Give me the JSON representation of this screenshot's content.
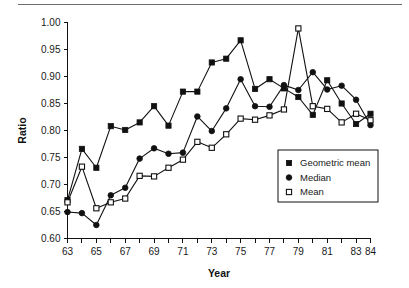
{
  "figure": {
    "name": "ratio-by-year-line-chart",
    "has_top_rule": true
  },
  "axis": {
    "y_title": "Ratio",
    "x_title": "Year",
    "y_ticks": [
      "0.60",
      "0.65",
      "0.70",
      "0.75",
      "0.80",
      "0.85",
      "0.90",
      "0.95",
      "1.00"
    ],
    "x_ticks": [
      "63",
      "65",
      "67",
      "69",
      "71",
      "73",
      "75",
      "77",
      "79",
      "81",
      "83",
      "84"
    ]
  },
  "legend": {
    "items": [
      {
        "label": "Geometric mean",
        "marker": "filled-square-marker",
        "color": "#111111"
      },
      {
        "label": "Median",
        "marker": "filled-circle-marker",
        "color": "#111111"
      },
      {
        "label": "Mean",
        "marker": "open-square-marker",
        "color": "#111111"
      }
    ]
  },
  "chart_data": {
    "type": "line",
    "title": "",
    "xlabel": "Year",
    "ylabel": "Ratio",
    "xlim": [
      63,
      84
    ],
    "ylim": [
      0.6,
      1.0
    ],
    "grid": false,
    "legend_position": "lower-right-inside",
    "x": [
      63,
      64,
      65,
      66,
      67,
      68,
      69,
      70,
      71,
      72,
      73,
      74,
      75,
      76,
      77,
      78,
      79,
      80,
      81,
      82,
      83,
      84
    ],
    "series": [
      {
        "name": "Geometric mean",
        "marker": "filled-square",
        "values": [
          0.671,
          0.766,
          0.731,
          0.808,
          0.801,
          0.815,
          0.845,
          0.809,
          0.872,
          0.872,
          0.926,
          0.933,
          0.967,
          0.877,
          0.895,
          0.878,
          0.862,
          0.829,
          0.893,
          0.85,
          0.812,
          0.831
        ]
      },
      {
        "name": "Median",
        "marker": "filled-circle",
        "values": [
          0.649,
          0.647,
          0.625,
          0.68,
          0.694,
          0.748,
          0.767,
          0.757,
          0.759,
          0.826,
          0.799,
          0.841,
          0.895,
          0.845,
          0.844,
          0.884,
          0.875,
          0.908,
          0.876,
          0.883,
          0.857,
          0.81
        ]
      },
      {
        "name": "Mean",
        "marker": "open-square",
        "values": [
          0.667,
          0.733,
          0.656,
          0.667,
          0.674,
          0.716,
          0.715,
          0.731,
          0.746,
          0.779,
          0.768,
          0.793,
          0.822,
          0.82,
          0.828,
          0.839,
          0.989,
          0.845,
          0.84,
          0.815,
          0.831,
          0.819
        ]
      }
    ]
  }
}
